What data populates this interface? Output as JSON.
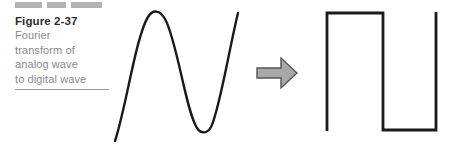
{
  "figure": {
    "number_label": "Figure 2-37",
    "caption_lines": [
      "Fourier",
      "transform of",
      "analog wave",
      "to digital wave"
    ],
    "decorative_bars": [
      "bar-wide",
      "bar-narrow",
      "bar-widest"
    ],
    "colors": {
      "bar_gray": "#b3b3b3",
      "caption_text": "#8a8a8a",
      "figure_number_text": "#2b2b2b",
      "rule_gray": "#9a9a9a",
      "wave_stroke": "#1a1a1a",
      "arrow_fill": "#a8a8a8",
      "arrow_stroke": "#555555",
      "background": "#ffffff"
    }
  },
  "diagram": {
    "analog_wave": {
      "name": "analog sine wave",
      "description": "continuous sinusoid rising, peaking, troughing, rising",
      "points": {
        "start": [
          115,
          140
        ],
        "peak": [
          155,
          12
        ],
        "trough": [
          202,
          130
        ],
        "end": [
          238,
          13
        ]
      }
    },
    "transform_arrow": {
      "name": "rightward block arrow",
      "direction": "right",
      "bounds": [
        256,
        58,
        296,
        88
      ]
    },
    "digital_wave": {
      "name": "digital square wave",
      "description": "square pulse train: high, low, high",
      "points": [
        [
          327,
          130
        ],
        [
          327,
          13
        ],
        [
          383,
          13
        ],
        [
          383,
          130
        ],
        [
          436,
          130
        ],
        [
          436,
          12
        ]
      ]
    }
  }
}
